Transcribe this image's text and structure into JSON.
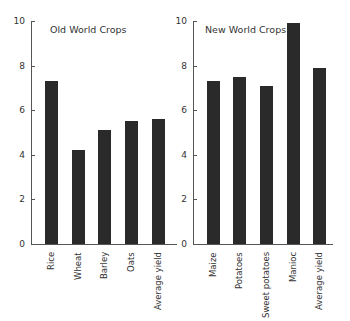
{
  "chart_data": [
    {
      "type": "bar",
      "title": "Old World Crops",
      "categories": [
        "Rice",
        "Wheat",
        "Barley",
        "Oats",
        "Average yield"
      ],
      "values": [
        7.3,
        4.2,
        5.1,
        5.5,
        5.6
      ],
      "xlabel": "",
      "ylabel": "",
      "ylim": [
        0,
        10
      ],
      "yticks": [
        0,
        2,
        4,
        6,
        8,
        10
      ],
      "grid": false,
      "legend": null
    },
    {
      "type": "bar",
      "title": "New World Crops",
      "categories": [
        "Maize",
        "Potatoes",
        "Sweet potatoes",
        "Manioc",
        "Average yield"
      ],
      "values": [
        7.3,
        7.5,
        7.1,
        9.9,
        7.9
      ],
      "xlabel": "",
      "ylabel": "",
      "ylim": [
        0,
        10
      ],
      "yticks": [
        0,
        2,
        4,
        6,
        8,
        10
      ],
      "grid": false,
      "legend": null
    }
  ],
  "colors": {
    "bar": "#2a2a2a",
    "axis": "#555555",
    "text": "#333333"
  },
  "tick_labels": [
    "0",
    "2",
    "4",
    "6",
    "8",
    "10"
  ]
}
